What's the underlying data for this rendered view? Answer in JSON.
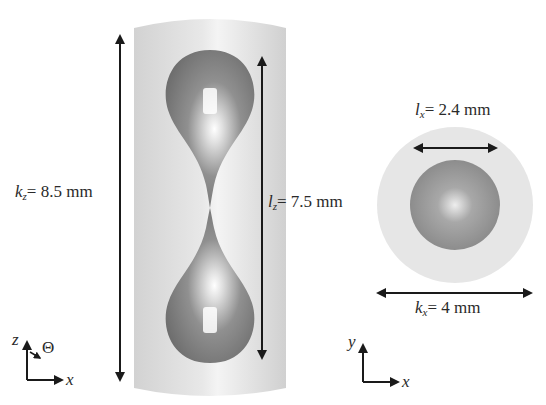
{
  "diagram": {
    "side_view": {
      "axes": {
        "vertical": "z",
        "horizontal": "x",
        "angle": "Θ"
      },
      "cylinder_height": {
        "var": "k",
        "sub": "z",
        "value": "= 8.5 mm"
      },
      "droplet_length": {
        "var": "l",
        "sub": "z",
        "value": "= 7.5 mm"
      }
    },
    "top_view": {
      "axes": {
        "vertical": "y",
        "horizontal": "x"
      },
      "droplet_diameter": {
        "var": "l",
        "sub": "x",
        "value": "= 2.4 mm"
      },
      "cylinder_diameter": {
        "var": "k",
        "sub": "x",
        "value": "= 4 mm"
      }
    },
    "colors": {
      "cylinder": "#dcdcdc",
      "droplet": "#8a8a8a",
      "highlight": "#ffffff",
      "arrow": "#1a1a1a"
    }
  }
}
